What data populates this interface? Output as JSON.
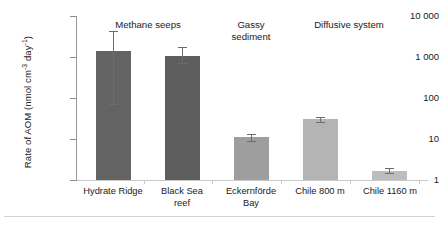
{
  "chart_data": {
    "type": "bar",
    "title": "",
    "xlabel": "",
    "ylabel": "Rate of AOM (nmol cm⁻³ day⁻¹)",
    "ylabel_parts": {
      "prefix": "Rate of AOM (nmol cm",
      "sup1": "-3",
      "mid": " day",
      "sup2": "-1",
      "suffix": ")"
    },
    "yscale": "log",
    "ylim": [
      1,
      10000
    ],
    "ytick_values": [
      1,
      10,
      100,
      1000,
      10000
    ],
    "ytick_labels": [
      "1",
      "10",
      "100",
      "1 000",
      "10 000"
    ],
    "grid": false,
    "legend": "none",
    "categories": [
      "Hydrate Ridge",
      "Black Sea reef",
      "Eckernförde Bay",
      "Chile 800 m",
      "Chile 1160 m"
    ],
    "values": [
      1400,
      1050,
      11,
      30,
      1.7
    ],
    "error_low": [
      70,
      700,
      9,
      26,
      1.45
    ],
    "error_high": [
      4200,
      1800,
      13,
      35,
      2.0
    ],
    "bar_colors": [
      "#636363",
      "#5e5e5e",
      "#9e9e9e",
      "#b4b4b4",
      "#bdbdbd"
    ],
    "group_annotations": [
      {
        "label": "Methane seeps",
        "spans": [
          "Hydrate Ridge",
          "Black Sea reef"
        ]
      },
      {
        "label": "Gassy sediment",
        "spans": [
          "Eckernförde Bay"
        ]
      },
      {
        "label": "Diffusive system",
        "spans": [
          "Chile 800 m",
          "Chile 1160 m"
        ]
      }
    ]
  },
  "axis": {
    "ticks": [
      {
        "label": "10 000"
      },
      {
        "label": "1 000"
      },
      {
        "label": "100"
      },
      {
        "label": "10"
      },
      {
        "label": "1"
      }
    ]
  },
  "categories": [
    {
      "line1": "Hydrate Ridge",
      "line2": ""
    },
    {
      "line1": "Black Sea",
      "line2": "reef"
    },
    {
      "line1": "Eckernförde",
      "line2": "Bay"
    },
    {
      "line1": "Chile 800 m",
      "line2": ""
    },
    {
      "line1": "Chile 1160 m",
      "line2": ""
    }
  ],
  "groups": [
    {
      "line1": "Methane seeps",
      "line2": ""
    },
    {
      "line1": "Gassy",
      "line2": "sediment"
    },
    {
      "line1": "Diffusive system",
      "line2": ""
    }
  ]
}
